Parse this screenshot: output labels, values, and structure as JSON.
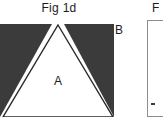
{
  "figure": {
    "title": "Fig 1d",
    "neighbor_title": "F",
    "labels": {
      "region_a": "A",
      "region_b": "B"
    },
    "colors": {
      "dark_region": "#3b3b3b",
      "outline": "#2a2a2a",
      "background": "#ffffff",
      "text": "#1b1b1b",
      "frame": "#8c8c8c"
    },
    "icons": {
      "triangle_wedge": "triangle-wedge-shape",
      "panel_frame": "panel-frame-shape"
    },
    "geometry": {
      "panel_left": 0,
      "panel_top": 24,
      "panel_width": 114,
      "panel_height": 93,
      "apex_x": 58,
      "apex_y": 1
    }
  }
}
